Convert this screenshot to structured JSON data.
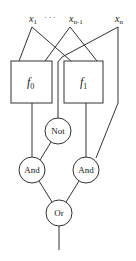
{
  "diagram": {
    "type": "logic-circuit",
    "inputs": {
      "x1": {
        "base": "x",
        "sub": "1"
      },
      "dots": "· · ·",
      "xn1": {
        "base": "x",
        "sub": "n-1"
      },
      "xn": {
        "base": "x",
        "sub": "n"
      }
    },
    "blocks": {
      "f0": {
        "base": "f",
        "sub": "0"
      },
      "f1": {
        "base": "f",
        "sub": "1"
      }
    },
    "gates": {
      "not": "Not",
      "and_left": "And",
      "and_right": "And",
      "or": "Or"
    },
    "colors": {
      "stroke": "#333333",
      "background": "#ffffff"
    }
  }
}
